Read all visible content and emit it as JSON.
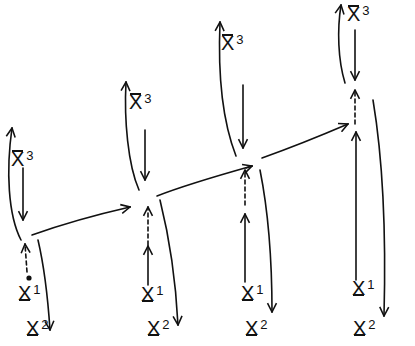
{
  "diagram": {
    "type": "hand-drawn sequence of state transitions",
    "stroke_color": "#111111",
    "background": "#ffffff",
    "nodes": [
      {
        "id": "n1",
        "top_label": {
          "sym": "X",
          "idx": "3"
        },
        "bottom_label": {
          "sym": "X",
          "idx": "1"
        },
        "out_label": {
          "sym": "X",
          "idx": "2"
        },
        "input_style": "dashed-with-dot"
      },
      {
        "id": "n2",
        "top_label": {
          "sym": "X",
          "idx": "3"
        },
        "bottom_label": {
          "sym": "X",
          "idx": "1"
        },
        "out_label": {
          "sym": "X",
          "idx": "2"
        },
        "input_style": "solid-then-dashed"
      },
      {
        "id": "n3",
        "top_label": {
          "sym": "X",
          "idx": "3"
        },
        "bottom_label": {
          "sym": "X",
          "idx": "1"
        },
        "out_label": {
          "sym": "X",
          "idx": "2"
        },
        "input_style": "solid-then-dashed"
      },
      {
        "id": "n4",
        "top_label": {
          "sym": "X",
          "idx": "3"
        },
        "bottom_label": {
          "sym": "X",
          "idx": "1"
        },
        "out_label": {
          "sym": "X",
          "idx": "2"
        },
        "input_style": "solid-then-dashed"
      }
    ],
    "edges": [
      {
        "from": "n1",
        "to": "n2"
      },
      {
        "from": "n2",
        "to": "n3"
      },
      {
        "from": "n3",
        "to": "n4"
      }
    ]
  }
}
